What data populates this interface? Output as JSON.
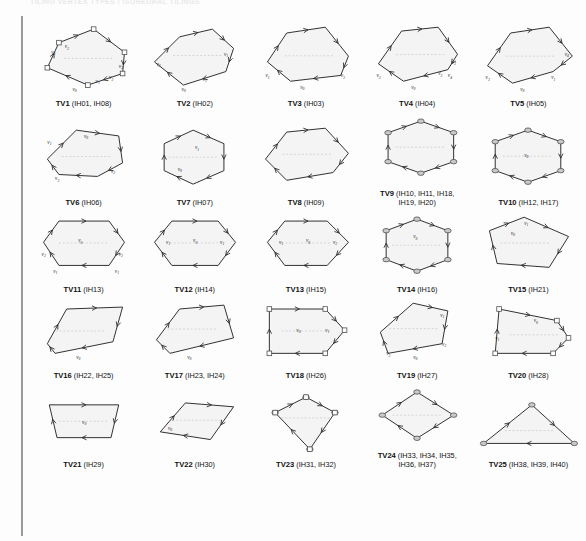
{
  "page": {
    "running_head": "TILING VERTEX TYPES / ISOHEDRAL TILINGS",
    "background_color": "#fdfdfd",
    "shape_fill_color": "#f4f4f4",
    "shape_stroke_color": "#2b2b2b",
    "marker_color": "#7a7a7a",
    "margin_rule_color": "#9a9a9a"
  },
  "figures": [
    {
      "id": "TV1",
      "name": "TV1",
      "codes": "(IH01, IH08)",
      "caption": "TV1 (IH01, IH08)",
      "shape": "hexagon-irregular",
      "vertex_labels": [
        "v0",
        "v1",
        "v2",
        "v3"
      ],
      "polygon": "18,46 30,20 66,6 98,30 96,52 60,64",
      "tick_edges": [
        1,
        3,
        5
      ],
      "corner_markers": [],
      "labels": [
        {
          "text": "v3",
          "x": 22,
          "y": 32
        },
        {
          "text": "v2",
          "x": 36,
          "y": 26
        },
        {
          "text": "v3",
          "x": 92,
          "y": 46
        },
        {
          "text": "v2",
          "x": 82,
          "y": 58
        },
        {
          "text": "v1",
          "x": 68,
          "y": 62
        },
        {
          "text": "v0",
          "x": 44,
          "y": 70
        }
      ]
    },
    {
      "id": "TV2",
      "name": "TV2",
      "codes": "(IH02)",
      "caption": "TV2 (IH02)",
      "shape": "hexagon-irregular",
      "polygon": "14,40 40,14 74,6 96,26 88,50 44,64",
      "vertex_labels": [
        "v0",
        "v1",
        "v2",
        "v3"
      ],
      "labels": [
        {
          "text": "v2",
          "x": 16,
          "y": 44
        },
        {
          "text": "v1",
          "x": 86,
          "y": 34
        },
        {
          "text": "v1",
          "x": 64,
          "y": 60
        },
        {
          "text": "v0",
          "x": 42,
          "y": 70
        }
      ]
    },
    {
      "id": "TV3",
      "name": "TV3",
      "codes": "(IH03)",
      "caption": "TV3 (IH03)",
      "shape": "hexagon-irregular",
      "polygon": "16,40 36,10 76,4 100,34 92,54 40,60",
      "vertex_labels": [
        "v0",
        "v1",
        "v2",
        "v3"
      ],
      "labels": [
        {
          "text": "v1",
          "x": 14,
          "y": 56
        },
        {
          "text": "v3",
          "x": 92,
          "y": 56
        },
        {
          "text": "v0",
          "x": 50,
          "y": 68
        }
      ]
    },
    {
      "id": "TV4",
      "name": "TV4",
      "codes": "(IH04)",
      "caption": "TV4 (IH04)",
      "shape": "hexagon-irregular",
      "polygon": "16,42 40,8 78,4 98,32 88,48 42,60",
      "vertex_labels": [
        "v0",
        "v1",
        "v2",
        "v3",
        "v4"
      ],
      "labels": [
        {
          "text": "v3",
          "x": 14,
          "y": 56
        },
        {
          "text": "v3",
          "x": 92,
          "y": 42
        },
        {
          "text": "v2",
          "x": 78,
          "y": 54
        },
        {
          "text": "v4",
          "x": 88,
          "y": 56
        },
        {
          "text": "v0",
          "x": 50,
          "y": 68
        }
      ]
    },
    {
      "id": "TV5",
      "name": "TV5",
      "codes": "(IH05)",
      "caption": "TV5 (IH05)",
      "shape": "hexagon-irregular",
      "polygon": "14,44 38,10 78,4 102,34 82,50 40,62",
      "vertex_labels": [
        "v0",
        "v1",
        "v2",
        "v3",
        "v4"
      ],
      "labels": [
        {
          "text": "v3",
          "x": 12,
          "y": 58
        },
        {
          "text": "v4",
          "x": 94,
          "y": 34
        },
        {
          "text": "v1",
          "x": 80,
          "y": 58
        },
        {
          "text": "v0",
          "x": 48,
          "y": 70
        }
      ]
    },
    {
      "id": "TV6",
      "name": "TV6",
      "codes": "(IH06)",
      "caption": "TV6 (IH06)",
      "shape": "hexagon-irregular",
      "polygon": "18,36 48,6 92,12 96,40 70,54 30,52",
      "vertex_labels": [
        "v0",
        "v1",
        "v2",
        "v3"
      ],
      "labels": [
        {
          "text": "v1",
          "x": 18,
          "y": 20
        },
        {
          "text": "v0",
          "x": 56,
          "y": 14
        },
        {
          "text": "v2",
          "x": 26,
          "y": 58
        },
        {
          "text": "v3",
          "x": 84,
          "y": 50
        }
      ]
    },
    {
      "id": "TV7",
      "name": "TV7",
      "codes": "(IH07)",
      "caption": "TV7 (IH07)",
      "shape": "hexagon-regular",
      "polygon": "24,20 54,6 86,20 86,48 54,62 24,48",
      "vertex_labels": [
        "v0",
        "v1"
      ],
      "labels": [
        {
          "text": "v1",
          "x": 56,
          "y": 26
        },
        {
          "text": "v0",
          "x": 38,
          "y": 48
        }
      ]
    },
    {
      "id": "TV8",
      "name": "TV8",
      "codes": "(IH09)",
      "caption": "TV8 (IH09)",
      "shape": "hexagon-irregular",
      "polygon": "14,36 36,8 76,4 100,30 84,50 36,58",
      "vertex_labels": [
        "v0"
      ],
      "labels": []
    },
    {
      "id": "TV9",
      "name": "TV9",
      "codes": "(IH10, IH11, IH18, IH19, IH20)",
      "caption": "TV9 (IH10, IH11, IH18,\nIH19, IH20)",
      "shape": "hexagon-regular",
      "polygon": "26,18 60,6 94,18 94,48 60,60 26,48",
      "vertex_markers": true,
      "labels": []
    },
    {
      "id": "TV10",
      "name": "TV10",
      "codes": "(IH12, IH17)",
      "caption": "TV10 (IH12, IH17)",
      "shape": "hexagon-regular",
      "polygon": "22,18 56,6 90,18 90,48 56,60 22,48",
      "vertex_markers": true,
      "labels": [
        {
          "text": "v0",
          "x": 52,
          "y": 34
        }
      ]
    },
    {
      "id": "TV11",
      "name": "TV11",
      "codes": "(IH13)",
      "caption": "TV11 (IH13)",
      "shape": "hexagon-wide",
      "polygon": "14,30 30,8 82,8 98,30 82,54 30,54",
      "vertex_labels": [
        "v0",
        "v1",
        "v2"
      ],
      "labels": [
        {
          "text": "v0",
          "x": 50,
          "y": 30
        },
        {
          "text": "v2",
          "x": 12,
          "y": 44
        },
        {
          "text": "v2",
          "x": 92,
          "y": 44
        },
        {
          "text": "v1",
          "x": 24,
          "y": 62
        },
        {
          "text": "v1",
          "x": 88,
          "y": 62
        }
      ]
    },
    {
      "id": "TV12",
      "name": "TV12",
      "codes": "(IH14)",
      "caption": "TV12 (IH14)",
      "shape": "hexagon-wide",
      "polygon": "14,30 32,8 80,8 98,30 80,54 32,54",
      "labels": [
        {
          "text": "v1",
          "x": 26,
          "y": 32
        },
        {
          "text": "v0",
          "x": 54,
          "y": 30
        },
        {
          "text": "v1",
          "x": 82,
          "y": 32
        }
      ]
    },
    {
      "id": "TV13",
      "name": "TV13",
      "codes": "(IH15)",
      "caption": "TV13 (IH15)",
      "shape": "hexagon-wide",
      "polygon": "16,30 34,8 78,8 100,30 78,54 34,54",
      "labels": [
        {
          "text": "v1",
          "x": 28,
          "y": 32
        },
        {
          "text": "v0",
          "x": 56,
          "y": 30
        },
        {
          "text": "v2",
          "x": 84,
          "y": 32
        }
      ]
    },
    {
      "id": "TV14",
      "name": "TV14",
      "codes": "(IH16)",
      "caption": "TV14 (IH16)",
      "shape": "hexagon-regular",
      "polygon": "24,18 56,6 88,18 88,48 56,60 24,48",
      "vertex_markers": true,
      "labels": [
        {
          "text": "v0",
          "x": 52,
          "y": 26
        }
      ]
    },
    {
      "id": "TV15",
      "name": "TV15",
      "codes": "(IH21)",
      "caption": "TV15 (IH21)",
      "shape": "pentagon",
      "polygon": "16,18 52,4 98,24 78,56 24,52",
      "labels": [
        {
          "text": "v1",
          "x": 52,
          "y": 12
        },
        {
          "text": "v0",
          "x": 38,
          "y": 22
        }
      ]
    },
    {
      "id": "TV16",
      "name": "TV16",
      "codes": "(IH22, IH25)",
      "caption": "TV16 (IH22, IH25)",
      "shape": "quad",
      "polygon": "18,46 38,10 96,8 86,44 26,56",
      "labels": [
        {
          "text": "v0",
          "x": 48,
          "y": 62
        }
      ]
    },
    {
      "id": "TV17",
      "name": "TV17",
      "codes": "(IH23, IH24)",
      "caption": "TV17 (IH23, IH24)",
      "shape": "pentagon",
      "polygon": "16,42 40,10 86,6 96,40 30,56",
      "labels": [
        {
          "text": "v0",
          "x": 48,
          "y": 62
        }
      ]
    },
    {
      "id": "TV18",
      "name": "TV18",
      "codes": "(IH26)",
      "caption": "TV18 (IH26)",
      "shape": "pentagon-arrow",
      "polygon": "18,10 76,10 96,32 76,56 18,56",
      "corner_markers": true,
      "labels": [
        {
          "text": "v0",
          "x": 46,
          "y": 34
        },
        {
          "text": "v1",
          "x": 76,
          "y": 34
        }
      ]
    },
    {
      "id": "TV19",
      "name": "TV19",
      "codes": "(IH27)",
      "caption": "TV19 (IH27)",
      "shape": "pentagon",
      "polygon": "18,34 52,4 88,12 82,46 26,56",
      "labels": [
        {
          "text": "v1",
          "x": 80,
          "y": 18
        },
        {
          "text": "v2",
          "x": 82,
          "y": 48
        },
        {
          "text": "v3",
          "x": 24,
          "y": 58
        },
        {
          "text": "v0",
          "x": 52,
          "y": 62
        }
      ]
    },
    {
      "id": "TV20",
      "name": "TV20",
      "codes": "(IH28)",
      "caption": "TV20 (IH28)",
      "shape": "pentagon",
      "polygon": "26,10 86,22 98,40 82,56 22,56",
      "corner_markers": true,
      "labels": [
        {
          "text": "v0",
          "x": 62,
          "y": 24
        },
        {
          "text": "v1",
          "x": 22,
          "y": 42
        }
      ]
    },
    {
      "id": "TV21",
      "name": "TV21",
      "codes": "(IH29)",
      "caption": "TV21 (IH29)",
      "shape": "trapezoid",
      "polygon": "20,14 92,14 84,48 28,48",
      "labels": [
        {
          "text": "v0",
          "x": 54,
          "y": 34
        }
      ]
    },
    {
      "id": "TV22",
      "name": "TV22",
      "codes": "(IH30)",
      "caption": "TV22 (IH30)",
      "shape": "parallelogram",
      "polygon": "20,42 46,12 96,16 72,50",
      "labels": [
        {
          "text": "v0",
          "x": 28,
          "y": 40
        }
      ]
    },
    {
      "id": "TV23",
      "name": "TV23",
      "codes": "(IH31, IH32)",
      "caption": "TV23 (IH31, IH32)",
      "shape": "kite",
      "polygon": "56,6 86,22 60,60 24,22",
      "vertex_markers": true,
      "corner_markers": true,
      "labels": []
    },
    {
      "id": "TV24",
      "name": "TV24",
      "codes": "(IH33, IH34, IH35, IH36, IH37)",
      "caption": "TV24 (IH33, IH34, IH35,\nIH36, IH37)",
      "shape": "rhombus",
      "polygon": "56,10 94,34 56,58 20,34",
      "vertex_markers": true,
      "labels": []
    },
    {
      "id": "TV25",
      "name": "TV25",
      "codes": "(IH38, IH39, IH40)",
      "caption": "TV25 (IH38, IH39, IH40)",
      "shape": "triangle",
      "polygon": "10,54 60,14 104,54",
      "vertex_markers": true,
      "labels": []
    }
  ]
}
